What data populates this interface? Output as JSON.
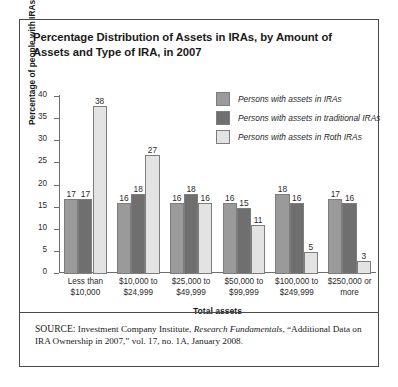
{
  "figure": {
    "title": "Percentage Distribution of Assets in IRAs, by Amount of Assets and Type of IRA, in 2007",
    "source_prefix": "SOURCE:",
    "source_part1": " Investment Company Institute, ",
    "source_italic": "Research Fundamentals",
    "source_part2": ", “Additional Data on IRA Ownership in 2007,” vol. 17, no. 1A, January 2008."
  },
  "colors": {
    "series_iras": "#9a9a9a",
    "series_traditional": "#6f6f6f",
    "series_roth": "#e3e3e3",
    "axis": "#6e6e6e",
    "border": "#4a4a4a",
    "text": "#1a1a1a"
  },
  "chart_data": {
    "type": "bar",
    "title": "Percentage Distribution of Assets in IRAs, by Amount of Assets and Type of IRA, in 2007",
    "xlabel": "Total assets",
    "ylabel": "Percentage of people with IRAs",
    "ylim": [
      0,
      40
    ],
    "yticks": [
      0,
      5,
      10,
      15,
      20,
      25,
      30,
      35,
      40
    ],
    "grid": false,
    "legend_position": "top-right",
    "categories": [
      "Less than\n$10,000",
      "$10,000 to\n$24,999",
      "$25,000 to\n$49,999",
      "$50,000 to\n$99,999",
      "$100,000 to\n$249,999",
      "$250,000 or\nmore"
    ],
    "series": [
      {
        "name": "Persons with assets in IRAs",
        "color": "#9a9a9a",
        "values": [
          17,
          16,
          16,
          16,
          18,
          17
        ]
      },
      {
        "name": "Persons with assets in traditional IRAs",
        "color": "#6f6f6f",
        "values": [
          17,
          18,
          18,
          15,
          16,
          16
        ]
      },
      {
        "name": "Persons with assets in Roth IRAs",
        "color": "#e3e3e3",
        "values": [
          38,
          27,
          16,
          11,
          5,
          3
        ]
      }
    ]
  }
}
